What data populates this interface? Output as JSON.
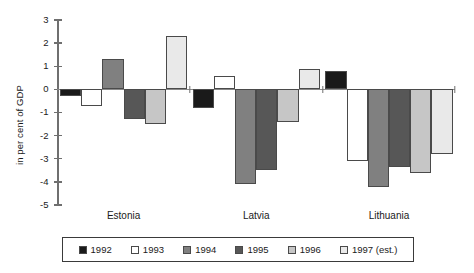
{
  "chart_data": {
    "type": "bar",
    "title": "",
    "subtitle": "",
    "xlabel": "",
    "ylabel": "in per cent of GDP",
    "ylim": [
      -5,
      3
    ],
    "yticks": [
      3,
      2,
      1,
      0,
      -1,
      -2,
      -3,
      -4,
      -5
    ],
    "ytick_labels": [
      "3",
      "2",
      "1",
      "0",
      "-1",
      "-2",
      "-3",
      "-4",
      "-5"
    ],
    "grid": false,
    "legend_position": "bottom",
    "categories": [
      "Estonia",
      "Latvia",
      "Lithuania"
    ],
    "series": [
      {
        "name": "1992",
        "color": "#1a1a1a",
        "values": [
          -0.3,
          -0.8,
          0.8
        ]
      },
      {
        "name": "1993",
        "color": "#ffffff",
        "values": [
          -0.7,
          0.6,
          -3.1
        ]
      },
      {
        "name": "1994",
        "color": "#808080",
        "values": [
          1.3,
          -4.1,
          -4.2
        ]
      },
      {
        "name": "1995",
        "color": "#575757",
        "values": [
          -1.3,
          -3.5,
          -3.35
        ]
      },
      {
        "name": "1996",
        "color": "#c6c6c6",
        "values": [
          -1.5,
          -1.4,
          -3.6
        ]
      },
      {
        "name": "1997 (est.)",
        "color": "#e9e9e9",
        "values": [
          2.3,
          0.9,
          -2.8
        ]
      }
    ]
  },
  "legend": {
    "items": [
      {
        "label": "1992",
        "color": "#1a1a1a"
      },
      {
        "label": "1993",
        "color": "#ffffff"
      },
      {
        "label": "1994",
        "color": "#808080"
      },
      {
        "label": "1995",
        "color": "#575757"
      },
      {
        "label": "1996",
        "color": "#c6c6c6"
      },
      {
        "label": "1997 (est.)",
        "color": "#e9e9e9"
      }
    ]
  }
}
